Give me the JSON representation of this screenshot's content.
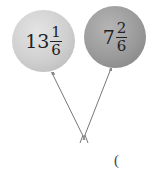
{
  "balloons": [
    {
      "whole": "13",
      "numerator": "1",
      "denominator": "6",
      "color": "#cfcfcf"
    },
    {
      "whole": "7",
      "numerator": "2",
      "denominator": "6",
      "color": "#9a9a9a"
    }
  ],
  "answer": {
    "open_paren": "("
  }
}
